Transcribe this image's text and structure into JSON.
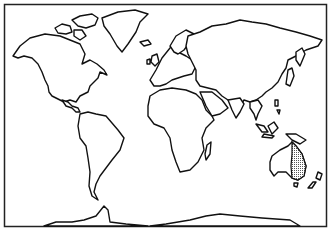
{
  "map": {
    "type": "world-outline",
    "projection": "equirectangular-like",
    "title": "",
    "highlighted_region": {
      "name": "Eastern Australia",
      "pattern": "stippled-dots",
      "fill_color": "#9a9a9a"
    },
    "colors": {
      "land_fill": "#ffffff",
      "outline": "#111111",
      "background": "#ffffff",
      "frame": "#222222"
    },
    "continents": [
      "North America",
      "Greenland",
      "South America",
      "Europe",
      "Africa",
      "Asia",
      "Australia",
      "Antarctica"
    ]
  }
}
